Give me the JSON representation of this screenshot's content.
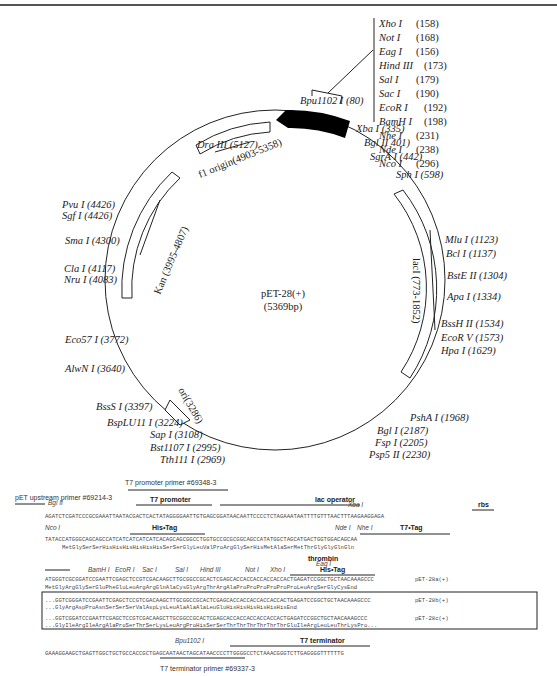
{
  "plasmid": {
    "name": "pET-28(+)",
    "size": "(5369bp)"
  },
  "top_site_list": [
    {
      "enzyme": "Xho I",
      "pos": "(158)"
    },
    {
      "enzyme": "Not I",
      "pos": "(168)"
    },
    {
      "enzyme": "Eag I",
      "pos": "(156)"
    },
    {
      "enzyme": "Hind III",
      "pos": "(173)"
    },
    {
      "enzyme": "Sal I",
      "pos": "(179)"
    },
    {
      "enzyme": "Sac I",
      "pos": "(190)"
    },
    {
      "enzyme": "EcoR I",
      "pos": "(192)"
    },
    {
      "enzyme": "BamH I",
      "pos": "(198)"
    },
    {
      "enzyme": "Nhe I",
      "pos": "(231)"
    },
    {
      "enzyme": "Nde I",
      "pos": "(238)"
    },
    {
      "enzyme": "Nco I",
      "pos": "(296)"
    }
  ],
  "sites": {
    "bpu1102": "Bpu1102 I (80)",
    "xba": "Xba I (335)",
    "bgl2": "Bgl II 401)",
    "sgra": "SgrA I (442)",
    "sph": "Sph I (598)",
    "mlu": "Mlu I (1123)",
    "bcl": "Bcl I (1137)",
    "bste2": "BstE II (1304)",
    "apa": "Apa I (1334)",
    "bssh2": "BssH II (1534)",
    "ecorv": "EcoR V (1573)",
    "hpa": "Hpa I (1629)",
    "psha": "PshA I (1968)",
    "bgl1": "Bgl I (2187)",
    "fsp": "Fsp I (2205)",
    "psp5": "Psp5 II (2230)",
    "tth111": "Tth111 I (2969)",
    "bst1107": "Bst1107 I (2995)",
    "sap": "Sap I (3108)",
    "bsplu11": "BspLU11 I (3224)",
    "bsss": "BssS I (3397)",
    "alwn": "AlwN I (3640)",
    "eco57": "Eco57 I (3772)",
    "nru": "Nru I (4083)",
    "cla": "Cla I (4117)",
    "sma": "Sma I (4300)",
    "sgf": "Sgf I (4426)",
    "pvu": "Pvu I (4426)",
    "dra3": "Dra III (5127)"
  },
  "features": {
    "f1": "f1 origin(4903-5358)",
    "kan": "Kan (3995-4807)",
    "laci": "lacI (773-1852)",
    "ori": "ori(3286)"
  },
  "sequence_panel": {
    "primers": {
      "t7_promoter_primer": "T7 promoter primer #69348-3",
      "pet_upstream_primer": "pET upstream primer #69214-3",
      "t7_terminator_primer": "T7 terminator primer #69337-3"
    },
    "annotations": {
      "bgl2": "Bgl II",
      "t7_promoter": "T7 promoter",
      "lac_operator": "lac operator",
      "xba": "Xba I",
      "rbs": "rbs",
      "nco": "Nco I",
      "his_tag_1": "His•Tag",
      "nde": "Nde I",
      "nhe": "Nhe I",
      "t7_tag": "T7•Tag",
      "thrombin": "thrombin",
      "bamh": "BamH I",
      "ecor": "EcoR I",
      "sac": "Sac I",
      "sal": "Sal I",
      "hind": "Hind III",
      "eag": "Eag I",
      "not": "Not I",
      "xho": "Xho I",
      "his_tag_2": "His•Tag",
      "bpu1102": "Bpu1102 I",
      "t7_terminator": "T7 terminator"
    },
    "rows": {
      "row1": "AGATCTCGATCCCGCGAAATTAATACGACTCACTATAGGGGAATTGTGAGCGGATAACAATTCCCCTCTAGAAATAATTTTGTTTAACTTTAAGAAGGAGA",
      "row2": "TATACCATGGGCAGCAGCCATCATCATCATCATCACAGCAGCGGCCTGGTGCCGCGCGGCAGCCATATGGCTAGCATGACTGGTGGACAGCAA",
      "row2_aa": "MetGlySerSerHisHisHisHisHisHisSerSerGlyLeuValProArgGlySerHisMetAlaSerMetThrGlyGlyGlnGln",
      "row3": "ATGGGTCGCGGATCCGAATTCGAGCTCCGTCGACAAGCTTGCGGCCGCACTCGAGCACCACCACCACCACCACTGAGATCCGGCTGCTAACAAAGCCC",
      "row3_aa": "MetGlyArgGlySerGluPheGluLeuArgArgGlnAlaCysGlyArgThrArgAlaProProProProProProLeuArgSerGlyCysEnd",
      "row3_label": "pET-28a(+)",
      "row4": "...GGTCGGGATCCGAATTCGAGCTCCGTCGACAAGCTTGCGGCCGCACTCGAGCACCACCACCACCACCACTGAGATCCGGCTGCTAACAAAGCCC",
      "row4_aa": "...GlyArgAspProAsnSerSerSerValAspLysLeuAlaAlaAlaLeuGluHisHisHisHisHisHisEnd",
      "row4_label": "pET-28b(+)",
      "row5": "...GGTCGGATCCGAATTCGAGCTCCGTCGACAAGCTTGCGGCCGCACTCGAGCACCACCACCACCACCACTGAGATCCGGCTGCTAACAAAGCCC",
      "row5_aa": "...GlyIleArgIleArgAlaProSerThrSerLysLeuArgProHisSerSerThrThrThrThrThrThrGluIleArgLeuLeuThrLysPro...",
      "row5_label": "pET-28c(+)",
      "row6": "GAAAGGAAGCTGAGTTGGCTGCTGCCACCGCTGAGCAATAACTAGCATAACCCCTTGGGGCCTCTAAACGGGTCTTGAGGGGTTTTTTG"
    }
  }
}
